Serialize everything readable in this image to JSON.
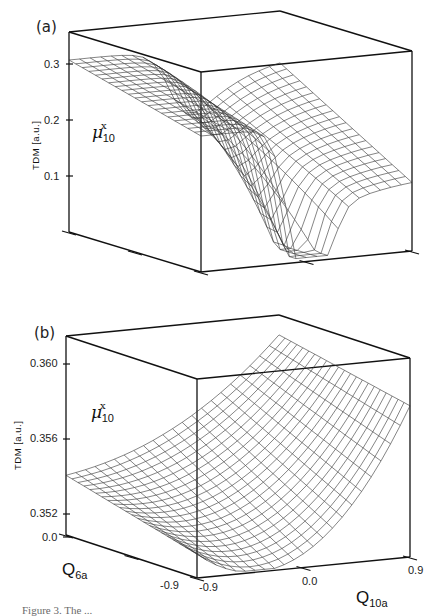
{
  "figure": {
    "caption": "Figure 3. The ..."
  },
  "chart_data": [
    {
      "type": "surface3d",
      "panel_label": "(a)",
      "title": "",
      "zlabel": "TDM [a.u.]",
      "surface_label": "μ^x_10",
      "z_ticks": [
        "0.1",
        "0.2",
        "0.3"
      ],
      "zlim": [
        0.0,
        0.35
      ],
      "x_axis": "Q6a (left depth axis)",
      "y_axis": "Q10a (front axis)",
      "description": "Wireframe surface of transition dipole moment μx10 with a sharp sign-change valley/drop near Q10a ≈ 0, plateau ~0.3 on left side, descending steeply toward 0 near the front center."
    },
    {
      "type": "surface3d",
      "panel_label": "(b)",
      "title": "",
      "zlabel": "TDM [a.u.]",
      "surface_label": "μ^x_10",
      "z_ticks": [
        "0.352",
        "0.356",
        "0.360"
      ],
      "zlim": [
        0.35,
        0.362
      ],
      "x_label": "Q6a",
      "x_ticks": [
        "0.0",
        "-0.9"
      ],
      "y_label": "Q10a",
      "y_ticks": [
        "-0.9",
        "0.0",
        "0.9"
      ],
      "description": "Smooth saddle-like wireframe surface; ~0.353 at Q6a=0,Q10a=-0.9, rising to ~0.360 at Q10a=0.9."
    }
  ],
  "panels": {
    "a": {
      "tag": "(a)",
      "ylabel": "TDM  [a.u.]",
      "mu": "μ",
      "mu_sup": "x",
      "mu_sub": "10",
      "ticks": [
        {
          "label": "0.3",
          "y": 64
        },
        {
          "label": "0.2",
          "y": 120
        },
        {
          "label": "0.1",
          "y": 176
        }
      ]
    },
    "b": {
      "tag": "(b)",
      "ylabel": "TDM  [a.u.]",
      "mu": "μ",
      "mu_sup": "x",
      "mu_sub": "10",
      "ticks": [
        {
          "label": "0.360",
          "y": 364
        },
        {
          "label": "0.356",
          "y": 439
        },
        {
          "label": "0.352",
          "y": 514
        },
        {
          "label": "0.0",
          "y": 537
        }
      ],
      "q6_label": "Q",
      "q6_sub": "6a",
      "q6_tick_low": "-0.9",
      "q10_label": "Q",
      "q10_sub": "10a",
      "q10_ticks": [
        "-0.9",
        "0.0",
        "0.9"
      ]
    }
  },
  "colors": {
    "axis": "#111111",
    "mesh": "#333333",
    "background": "#ffffff"
  }
}
